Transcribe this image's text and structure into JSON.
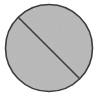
{
  "canvas": {
    "width": 98,
    "height": 96,
    "background_color": "#ffffff",
    "description": "Gray circle bisected by a diagonal line"
  },
  "graphic": {
    "name": "circle-with-diagonal-line",
    "shapes": {
      "circle": {
        "label": "circle-shape",
        "center_x": 49,
        "center_y": 48,
        "radius": 43.5,
        "fill_color": "#b8b8b8",
        "stroke_color": "#3d3d3d",
        "stroke_width": 1.6
      },
      "diagonal_line": {
        "label": "diagonal-chord",
        "x1": 18.5,
        "y1": 17.5,
        "x2": 79.5,
        "y2": 78.5,
        "stroke_color": "#3d3d3d",
        "stroke_width": 1.6,
        "orientation": "upper-left to lower-right"
      }
    },
    "texture": {
      "label": "grain-texture",
      "type": "noise",
      "intensity": "subtle"
    }
  }
}
